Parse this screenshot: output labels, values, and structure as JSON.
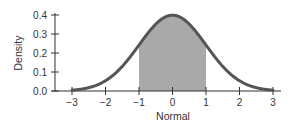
{
  "chart_data": {
    "type": "area",
    "title": "",
    "xlabel": "Normal",
    "ylabel": "Density",
    "xlim": [
      -3,
      3
    ],
    "ylim": [
      0.0,
      0.4
    ],
    "x_ticks": [
      -3,
      -2,
      -1,
      0,
      1,
      2,
      3
    ],
    "x_tick_labels": [
      "−3",
      "−2",
      "−1",
      "0",
      "1",
      "2",
      "3"
    ],
    "y_ticks": [
      0.0,
      0.1,
      0.2,
      0.3,
      0.4
    ],
    "y_tick_labels": [
      "0.0",
      "0.1",
      "0.2",
      "0.3",
      "0.4"
    ],
    "grid": false,
    "legend": null,
    "series": [
      {
        "name": "Standard normal density",
        "distribution": "normal",
        "mean": 0,
        "sd": 1,
        "x": [
          -3,
          -2.5,
          -2,
          -1.5,
          -1,
          -0.5,
          0,
          0.5,
          1,
          1.5,
          2,
          2.5,
          3
        ],
        "values": [
          0.004,
          0.018,
          0.054,
          0.13,
          0.242,
          0.352,
          0.399,
          0.352,
          0.242,
          0.13,
          0.054,
          0.018,
          0.004
        ]
      }
    ],
    "shaded_region": {
      "from": -1,
      "to": 1,
      "label": ""
    },
    "colors": {
      "curve": "#555555",
      "fill": "#a9a9a9",
      "axis": "#333333"
    }
  }
}
